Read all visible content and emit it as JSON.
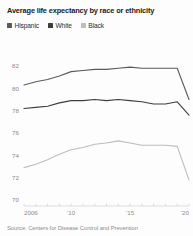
{
  "header": {
    "title": "Average life expectancy by race or ethnicity"
  },
  "legend": {
    "position": "top-left",
    "items": [
      {
        "label": "Hispanic",
        "color": "#5a5a5a"
      },
      {
        "label": "White",
        "color": "#3d3d3d"
      },
      {
        "label": "Black",
        "color": "#bdbdbd"
      }
    ]
  },
  "footer": {
    "source": "Source: Centers for Disease Control and Prevention"
  },
  "chart_data": {
    "type": "line",
    "title": "Average life expectancy by race or ethnicity",
    "xlabel": "",
    "ylabel": "",
    "grid": false,
    "legend_position": "top-left",
    "x": [
      2006,
      2007,
      2008,
      2009,
      2010,
      2011,
      2012,
      2013,
      2014,
      2015,
      2016,
      2017,
      2018,
      2019,
      2020
    ],
    "xtick_values": [
      2006,
      2010,
      2015,
      2020
    ],
    "xtick_labels": [
      "2006",
      "'10",
      "'15",
      "'20"
    ],
    "xlim": [
      2006,
      2020
    ],
    "ylim": [
      70,
      82.9
    ],
    "ytick_values": [
      70,
      72,
      74,
      76,
      78,
      80,
      82
    ],
    "ytick_labels": [
      "70",
      "72",
      "74",
      "76",
      "78",
      "80",
      "82"
    ],
    "series": [
      {
        "name": "Hispanic",
        "color": "#5a5a5a",
        "values": [
          80.3,
          80.6,
          80.8,
          81.1,
          81.5,
          81.6,
          81.7,
          81.7,
          81.8,
          81.9,
          81.8,
          81.8,
          81.8,
          81.8,
          79.0
        ]
      },
      {
        "name": "White",
        "color": "#3d3d3d",
        "values": [
          78.2,
          78.3,
          78.4,
          78.7,
          78.9,
          78.9,
          79.0,
          78.9,
          79.0,
          78.9,
          78.8,
          78.6,
          78.6,
          78.8,
          77.6
        ]
      },
      {
        "name": "Black",
        "color": "#bdbdbd",
        "values": [
          72.9,
          73.2,
          73.6,
          74.1,
          74.5,
          74.7,
          75.0,
          75.1,
          75.3,
          75.1,
          74.9,
          74.9,
          74.9,
          74.8,
          71.8
        ]
      }
    ]
  }
}
